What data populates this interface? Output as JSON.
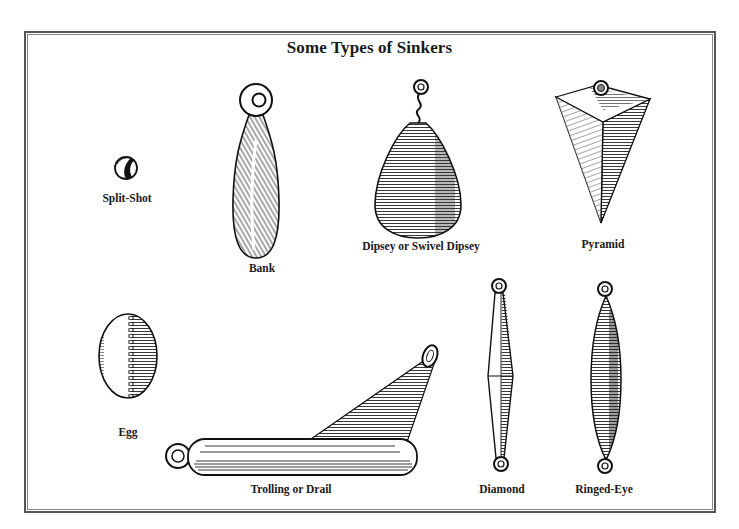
{
  "title": "Some Types of Sinkers",
  "sinkers": [
    {
      "id": "split-shot",
      "label": "Split-Shot"
    },
    {
      "id": "bank",
      "label": "Bank"
    },
    {
      "id": "dipsey",
      "label": "Dipsey or Swivel Dipsey"
    },
    {
      "id": "pyramid",
      "label": "Pyramid"
    },
    {
      "id": "egg",
      "label": "Egg"
    },
    {
      "id": "trolling",
      "label": "Trolling or Drail"
    },
    {
      "id": "diamond",
      "label": "Diamond"
    },
    {
      "id": "ringed-eye",
      "label": "Ringed-Eye"
    }
  ],
  "colors": {
    "ink": "#1a1a1a",
    "border": "#555555",
    "background": "#ffffff"
  }
}
